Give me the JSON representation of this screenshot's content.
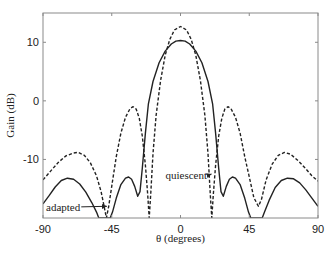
{
  "chart_data": {
    "type": "line",
    "title": "",
    "xlabel": "θ (degrees)",
    "ylabel": "Gain (dB)",
    "xlim": [
      -90,
      90
    ],
    "ylim": [
      -20,
      15
    ],
    "xticks": [
      -90,
      -45,
      0,
      45,
      90
    ],
    "xtick_labels": [
      "-90",
      "-45",
      "0",
      "45",
      "90"
    ],
    "yticks": [
      -10,
      0,
      10
    ],
    "ytick_labels": [
      "-10",
      "0",
      "10"
    ],
    "grid": false,
    "legend": null,
    "series": [
      {
        "name": "quiescent",
        "style": "dashed",
        "color": "#222222",
        "points": [
          [
            -90,
            -13.5
          ],
          [
            -85,
            -12.0
          ],
          [
            -80,
            -10.5
          ],
          [
            -75,
            -9.4
          ],
          [
            -70,
            -8.9
          ],
          [
            -67,
            -8.8
          ],
          [
            -63,
            -9.3
          ],
          [
            -59,
            -10.6
          ],
          [
            -55,
            -12.8
          ],
          [
            -52,
            -15.5
          ],
          [
            -50,
            -18.0
          ],
          [
            -48.5,
            -20.0
          ],
          [
            -47,
            -18.0
          ],
          [
            -45,
            -14.5
          ],
          [
            -42,
            -9.5
          ],
          [
            -39,
            -5.5
          ],
          [
            -36,
            -2.8
          ],
          [
            -33,
            -1.3
          ],
          [
            -31,
            -1.0
          ],
          [
            -29,
            -1.4
          ],
          [
            -27,
            -3.0
          ],
          [
            -25,
            -6.0
          ],
          [
            -23,
            -11.0
          ],
          [
            -21.5,
            -16.0
          ],
          [
            -20.5,
            -20.0
          ],
          [
            -19.5,
            -16.0
          ],
          [
            -18,
            -9.0
          ],
          [
            -16,
            -2.5
          ],
          [
            -13,
            3.5
          ],
          [
            -10,
            7.8
          ],
          [
            -7,
            10.5
          ],
          [
            -4,
            12.1
          ],
          [
            0,
            12.7
          ],
          [
            4,
            12.1
          ],
          [
            7,
            10.5
          ],
          [
            10,
            7.8
          ],
          [
            13,
            3.5
          ],
          [
            16,
            -2.5
          ],
          [
            18,
            -9.0
          ],
          [
            19.5,
            -16.0
          ],
          [
            20.5,
            -20.0
          ],
          [
            21.5,
            -16.0
          ],
          [
            23,
            -11.0
          ],
          [
            25,
            -6.0
          ],
          [
            27,
            -3.0
          ],
          [
            29,
            -1.4
          ],
          [
            31,
            -1.0
          ],
          [
            33,
            -1.3
          ],
          [
            36,
            -2.8
          ],
          [
            39,
            -5.5
          ],
          [
            42,
            -9.5
          ],
          [
            45,
            -13.0
          ],
          [
            48,
            -16.5
          ],
          [
            51,
            -18.0
          ],
          [
            53,
            -16.8
          ],
          [
            56,
            -13.5
          ],
          [
            60,
            -10.8
          ],
          [
            64,
            -9.3
          ],
          [
            68,
            -8.8
          ],
          [
            72,
            -9.1
          ],
          [
            77,
            -10.2
          ],
          [
            82,
            -11.6
          ],
          [
            86,
            -12.8
          ],
          [
            90,
            -13.7
          ]
        ]
      },
      {
        "name": "adapted",
        "style": "solid",
        "color": "#222222",
        "points": [
          [
            -90,
            -17.6
          ],
          [
            -86,
            -16.2
          ],
          [
            -82,
            -14.7
          ],
          [
            -78,
            -13.6
          ],
          [
            -74,
            -13.2
          ],
          [
            -70,
            -13.4
          ],
          [
            -66,
            -14.2
          ],
          [
            -62,
            -15.6
          ],
          [
            -58,
            -17.4
          ],
          [
            -55,
            -19.0
          ],
          [
            -53.5,
            -20.0
          ],
          [
            -46,
            -20.0
          ],
          [
            -44.5,
            -19.0
          ],
          [
            -42,
            -16.6
          ],
          [
            -39,
            -14.3
          ],
          [
            -36,
            -13.2
          ],
          [
            -34,
            -13.0
          ],
          [
            -32,
            -13.4
          ],
          [
            -30,
            -14.6
          ],
          [
            -28,
            -16.3
          ],
          [
            -26.5,
            -15.5
          ],
          [
            -25,
            -11.5
          ],
          [
            -23,
            -5.5
          ],
          [
            -21,
            -0.5
          ],
          [
            -18,
            3.3
          ],
          [
            -14,
            6.5
          ],
          [
            -10,
            8.5
          ],
          [
            -6,
            9.7
          ],
          [
            -3,
            10.2
          ],
          [
            0,
            10.3
          ],
          [
            3,
            10.2
          ],
          [
            6,
            9.7
          ],
          [
            10,
            8.5
          ],
          [
            14,
            6.5
          ],
          [
            18,
            3.3
          ],
          [
            21,
            -0.5
          ],
          [
            23,
            -5.5
          ],
          [
            25,
            -11.5
          ],
          [
            26.5,
            -15.5
          ],
          [
            28,
            -16.3
          ],
          [
            30,
            -14.6
          ],
          [
            32,
            -13.4
          ],
          [
            34,
            -13.0
          ],
          [
            36,
            -13.2
          ],
          [
            39,
            -14.3
          ],
          [
            42,
            -16.6
          ],
          [
            44.5,
            -19.0
          ],
          [
            46,
            -20.0
          ],
          [
            53.5,
            -20.0
          ],
          [
            55,
            -19.0
          ],
          [
            58,
            -17.0
          ],
          [
            62,
            -14.8
          ],
          [
            66,
            -13.6
          ],
          [
            70,
            -13.2
          ],
          [
            74,
            -13.3
          ],
          [
            78,
            -14.0
          ],
          [
            82,
            -15.2
          ],
          [
            86,
            -16.6
          ],
          [
            90,
            -18.0
          ]
        ]
      }
    ],
    "annotations": [
      {
        "text": "quiescent",
        "text_x": -9.8,
        "text_y": -12.7,
        "arrow_to_x": 21.0,
        "arrow_to_y": -12.5
      },
      {
        "text": "adapted",
        "text_x": -88.0,
        "text_y": -18.1,
        "arrow_to_x": -47.5,
        "arrow_to_y": -18.0
      }
    ]
  },
  "axes": {
    "x_title": "θ (degrees)",
    "y_title": "Gain (dB)"
  },
  "labels": {
    "quiescent": "quiescent",
    "adapted": "adapted"
  }
}
